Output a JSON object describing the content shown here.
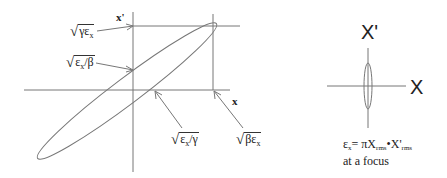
{
  "left_diagram": {
    "axis_x_label": "x",
    "axis_xp_label": "x'",
    "labels": {
      "sqrt_gamma_eps": "γε",
      "sqrt_gamma_eps_sub": "x",
      "sqrt_eps_beta": "ε",
      "sqrt_eps_beta_sub": "x",
      "sqrt_eps_beta_rest": "/β",
      "sqrt_eps_gamma": "ε",
      "sqrt_eps_gamma_sub": "x",
      "sqrt_eps_gamma_rest": "/γ",
      "sqrt_beta_eps": "βε",
      "sqrt_beta_eps_sub": "x"
    }
  },
  "right_diagram": {
    "axis_x_label": "X",
    "axis_xp_label": "X'",
    "caption_line1_eps": "ε",
    "caption_line1_sub": "x",
    "caption_line1_mid": "= πX",
    "caption_line1_rms1": "rms",
    "caption_line1_dot": "•X'",
    "caption_line1_rms2": "rms",
    "caption_line2": "at a focus"
  }
}
